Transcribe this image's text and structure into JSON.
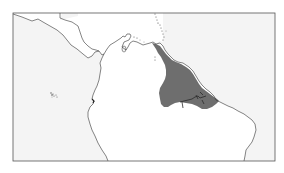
{
  "map": {
    "title": "Species range map: northeastern South America",
    "colors": {
      "ocean": "#f4f4f4",
      "land": "#ffffff",
      "coastline": "#333333",
      "range": "#6e6e6e",
      "frame": "#555555",
      "page_background": "#ffffff"
    },
    "regions_shown": [
      "Central America",
      "Caribbean",
      "Northern South America",
      "Galápagos Islands"
    ],
    "range_description": "Shaded distribution covering the Guianas and northern Brazil (Amazon delta region)"
  }
}
